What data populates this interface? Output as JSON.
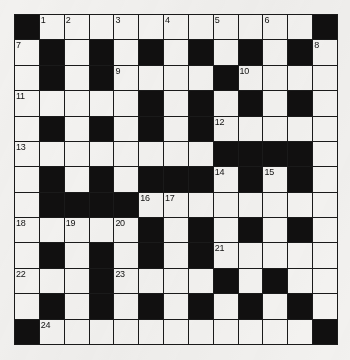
{
  "puzzle": {
    "type": "crossword-grid",
    "title": "Crossword Puzzle Grid",
    "rows": 13,
    "columns": 13,
    "colors": {
      "block": "#111010",
      "open": "#f4f3f1",
      "gridline": "#1a1a1a",
      "page_background": "#f2f1ef",
      "number_text": "#121212"
    },
    "clue_numbers": [
      1,
      2,
      3,
      4,
      5,
      6,
      7,
      8,
      9,
      10,
      11,
      12,
      13,
      14,
      15,
      16,
      17,
      18,
      19,
      20,
      21,
      22,
      23,
      24
    ],
    "grid": [
      [
        {
          "block": true
        },
        {
          "block": false,
          "num": "1"
        },
        {
          "block": false,
          "num": "2"
        },
        {
          "block": false
        },
        {
          "block": false,
          "num": "3"
        },
        {
          "block": false
        },
        {
          "block": false,
          "num": "4"
        },
        {
          "block": false
        },
        {
          "block": false,
          "num": "5"
        },
        {
          "block": false
        },
        {
          "block": false,
          "num": "6"
        },
        {
          "block": false
        },
        {
          "block": true
        }
      ],
      [
        {
          "block": false,
          "num": "7"
        },
        {
          "block": true
        },
        {
          "block": false
        },
        {
          "block": true
        },
        {
          "block": false
        },
        {
          "block": true
        },
        {
          "block": false
        },
        {
          "block": true
        },
        {
          "block": false
        },
        {
          "block": true
        },
        {
          "block": false
        },
        {
          "block": true
        },
        {
          "block": false,
          "num": "8"
        }
      ],
      [
        {
          "block": false
        },
        {
          "block": true
        },
        {
          "block": false
        },
        {
          "block": true
        },
        {
          "block": false,
          "num": "9"
        },
        {
          "block": false
        },
        {
          "block": false
        },
        {
          "block": false
        },
        {
          "block": true
        },
        {
          "block": false,
          "num": "10"
        },
        {
          "block": false
        },
        {
          "block": false
        },
        {
          "block": false
        }
      ],
      [
        {
          "block": false,
          "num": "11"
        },
        {
          "block": false
        },
        {
          "block": false
        },
        {
          "block": false
        },
        {
          "block": false
        },
        {
          "block": true
        },
        {
          "block": false
        },
        {
          "block": true
        },
        {
          "block": false
        },
        {
          "block": true
        },
        {
          "block": false
        },
        {
          "block": true
        },
        {
          "block": false
        }
      ],
      [
        {
          "block": false
        },
        {
          "block": true
        },
        {
          "block": false
        },
        {
          "block": true
        },
        {
          "block": false
        },
        {
          "block": true
        },
        {
          "block": false
        },
        {
          "block": true
        },
        {
          "block": false,
          "num": "12"
        },
        {
          "block": false
        },
        {
          "block": false
        },
        {
          "block": false
        },
        {
          "block": false
        }
      ],
      [
        {
          "block": false,
          "num": "13"
        },
        {
          "block": false
        },
        {
          "block": false
        },
        {
          "block": false
        },
        {
          "block": false
        },
        {
          "block": false
        },
        {
          "block": false
        },
        {
          "block": false
        },
        {
          "block": true
        },
        {
          "block": true
        },
        {
          "block": true
        },
        {
          "block": true
        },
        {
          "block": false
        }
      ],
      [
        {
          "block": false
        },
        {
          "block": true
        },
        {
          "block": false
        },
        {
          "block": true
        },
        {
          "block": false
        },
        {
          "block": true
        },
        {
          "block": true
        },
        {
          "block": true
        },
        {
          "block": false,
          "num": "14"
        },
        {
          "block": true
        },
        {
          "block": false,
          "num": "15"
        },
        {
          "block": true
        },
        {
          "block": false
        }
      ],
      [
        {
          "block": false
        },
        {
          "block": true
        },
        {
          "block": true
        },
        {
          "block": true
        },
        {
          "block": true
        },
        {
          "block": false,
          "num": "16"
        },
        {
          "block": false,
          "num": "17"
        },
        {
          "block": false
        },
        {
          "block": false
        },
        {
          "block": false
        },
        {
          "block": false
        },
        {
          "block": false
        },
        {
          "block": false
        }
      ],
      [
        {
          "block": false,
          "num": "18"
        },
        {
          "block": false
        },
        {
          "block": false,
          "num": "19"
        },
        {
          "block": false
        },
        {
          "block": false,
          "num": "20"
        },
        {
          "block": true
        },
        {
          "block": false
        },
        {
          "block": true
        },
        {
          "block": false
        },
        {
          "block": true
        },
        {
          "block": false
        },
        {
          "block": true
        },
        {
          "block": false
        }
      ],
      [
        {
          "block": false
        },
        {
          "block": true
        },
        {
          "block": false
        },
        {
          "block": true
        },
        {
          "block": false
        },
        {
          "block": true
        },
        {
          "block": false
        },
        {
          "block": true
        },
        {
          "block": false,
          "num": "21"
        },
        {
          "block": false
        },
        {
          "block": false
        },
        {
          "block": false
        },
        {
          "block": false
        }
      ],
      [
        {
          "block": false,
          "num": "22"
        },
        {
          "block": false
        },
        {
          "block": false
        },
        {
          "block": true
        },
        {
          "block": false,
          "num": "23"
        },
        {
          "block": false
        },
        {
          "block": false
        },
        {
          "block": false
        },
        {
          "block": true
        },
        {
          "block": false
        },
        {
          "block": true
        },
        {
          "block": false
        },
        {
          "block": false
        }
      ],
      [
        {
          "block": false
        },
        {
          "block": true
        },
        {
          "block": false
        },
        {
          "block": true
        },
        {
          "block": false
        },
        {
          "block": true
        },
        {
          "block": false
        },
        {
          "block": true
        },
        {
          "block": false
        },
        {
          "block": true
        },
        {
          "block": false
        },
        {
          "block": true
        },
        {
          "block": false
        }
      ],
      [
        {
          "block": true
        },
        {
          "block": false,
          "num": "24"
        },
        {
          "block": false
        },
        {
          "block": false
        },
        {
          "block": false
        },
        {
          "block": false
        },
        {
          "block": false
        },
        {
          "block": false
        },
        {
          "block": false
        },
        {
          "block": false
        },
        {
          "block": false
        },
        {
          "block": false
        },
        {
          "block": true
        }
      ]
    ]
  }
}
